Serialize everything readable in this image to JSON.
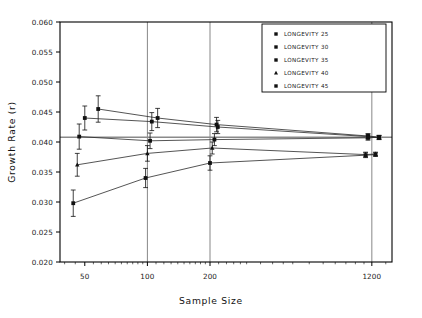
{
  "chart_data": {
    "type": "scatter",
    "title": "",
    "xlabel": "Sample Size",
    "ylabel": "Growth Rate (r)",
    "xscale": "log",
    "xlim": [
      38,
      1500
    ],
    "ylim": [
      0.02,
      0.06
    ],
    "yticks": [
      "0.020",
      "0.025",
      "0.030",
      "0.035",
      "0.040",
      "0.045",
      "0.050",
      "0.055",
      "0.060"
    ],
    "ytick_values": [
      0.02,
      0.025,
      0.03,
      0.035,
      0.04,
      0.045,
      0.05,
      0.055,
      0.06
    ],
    "xticks": [
      "50",
      "100",
      "200",
      "1200"
    ],
    "xtick_values": [
      50,
      100,
      200,
      1200
    ],
    "gridlines": {
      "vertical_at": [
        100,
        200,
        1200
      ],
      "horizontal_reference": 0.0408
    },
    "grid": "partial",
    "legend_position": "top-right",
    "error_bars": "vertical",
    "series": [
      {
        "name": "LONGEVITY 25",
        "marker": "square",
        "color": "#111111",
        "points": [
          {
            "x": 58,
            "y": 0.0455,
            "err": 0.0022
          },
          {
            "x": 112,
            "y": 0.044,
            "err": 0.0016
          },
          {
            "x": 215,
            "y": 0.0429,
            "err": 0.0012
          },
          {
            "x": 1150,
            "y": 0.041,
            "err": 0.0004
          },
          {
            "x": 1300,
            "y": 0.0408,
            "err": 0.0003
          }
        ]
      },
      {
        "name": "LONGEVITY 30",
        "marker": "square",
        "color": "#111111",
        "points": [
          {
            "x": 50,
            "y": 0.044,
            "err": 0.002
          },
          {
            "x": 105,
            "y": 0.0434,
            "err": 0.0015
          },
          {
            "x": 218,
            "y": 0.0425,
            "err": 0.0011
          },
          {
            "x": 1150,
            "y": 0.0409,
            "err": 0.0004
          },
          {
            "x": 1300,
            "y": 0.0407,
            "err": 0.0003
          }
        ]
      },
      {
        "name": "LONGEVITY 35",
        "marker": "square",
        "color": "#111111",
        "points": [
          {
            "x": 47,
            "y": 0.0409,
            "err": 0.0021
          },
          {
            "x": 103,
            "y": 0.0402,
            "err": 0.0013
          },
          {
            "x": 210,
            "y": 0.0404,
            "err": 0.001
          },
          {
            "x": 1150,
            "y": 0.0407,
            "err": 0.0004
          },
          {
            "x": 1300,
            "y": 0.0408,
            "err": 0.0003
          }
        ]
      },
      {
        "name": "LONGEVITY 40",
        "marker": "triangle",
        "color": "#111111",
        "points": [
          {
            "x": 46,
            "y": 0.0362,
            "err": 0.0019
          },
          {
            "x": 100,
            "y": 0.0381,
            "err": 0.0013
          },
          {
            "x": 205,
            "y": 0.039,
            "err": 0.001
          },
          {
            "x": 1120,
            "y": 0.0379,
            "err": 0.0004
          },
          {
            "x": 1250,
            "y": 0.038,
            "err": 0.0003
          }
        ]
      },
      {
        "name": "LONGEVITY 45",
        "marker": "square",
        "color": "#111111",
        "points": [
          {
            "x": 44,
            "y": 0.0298,
            "err": 0.0022
          },
          {
            "x": 98,
            "y": 0.034,
            "err": 0.0016
          },
          {
            "x": 200,
            "y": 0.0365,
            "err": 0.0012
          },
          {
            "x": 1120,
            "y": 0.0378,
            "err": 0.0004
          },
          {
            "x": 1250,
            "y": 0.0379,
            "err": 0.0003
          }
        ]
      }
    ]
  },
  "legend": {
    "items": [
      {
        "label": "LONGEVITY 25",
        "marker": "square"
      },
      {
        "label": "LONGEVITY 30",
        "marker": "square"
      },
      {
        "label": "LONGEVITY 35",
        "marker": "square"
      },
      {
        "label": "LONGEVITY 40",
        "marker": "triangle"
      },
      {
        "label": "LONGEVITY 45",
        "marker": "square"
      }
    ]
  },
  "axes": {
    "x_title": "Sample Size",
    "y_title": "Growth Rate (r)"
  },
  "colors": {
    "line": "#2a2a2a",
    "marker": "#111111",
    "frame": "#000000",
    "grid": "#555555",
    "reference_line": "#8a8a8a",
    "background": "#ffffff"
  }
}
